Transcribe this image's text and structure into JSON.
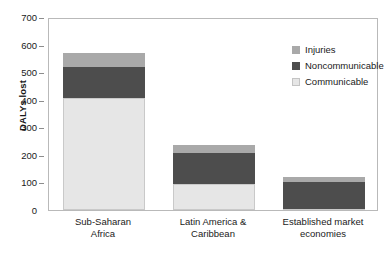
{
  "chart_data": {
    "type": "bar",
    "barmode": "stacked",
    "title": "",
    "xlabel": "",
    "ylabel": "DALYs lost",
    "ylim": [
      0,
      700
    ],
    "yticks": [
      0,
      100,
      200,
      300,
      400,
      500,
      600,
      700
    ],
    "ytick_labels": [
      "0",
      "100",
      "200",
      "300",
      "400",
      "500",
      "600",
      "700"
    ],
    "grid": false,
    "legend_position": "top-right",
    "categories": [
      "Sub-Saharan Africa",
      "Latin America & Caribbean",
      "Established market economies"
    ],
    "category_lines": [
      [
        "Sub-Saharan",
        "Africa"
      ],
      [
        "Latin America &",
        "Caribbean"
      ],
      [
        "Established market",
        "economies"
      ]
    ],
    "series": [
      {
        "name": "Communicable",
        "color": "#e6e6e6",
        "values": [
          408,
          96,
          5
        ]
      },
      {
        "name": "Noncommunicable",
        "color": "#4d4d4d",
        "values": [
          110,
          111,
          98
        ]
      },
      {
        "name": "Injuries",
        "color": "#a9a9a9",
        "values": [
          52,
          28,
          15
        ]
      }
    ],
    "totals": [
      570,
      235,
      118
    ],
    "legend_order": [
      "Injuries",
      "Noncommunicable",
      "Communicable"
    ]
  },
  "legend": {
    "items": [
      {
        "label": "Injuries",
        "swatch_class": "sw-injuries"
      },
      {
        "label": "Noncommunicable",
        "swatch_class": "sw-noncommunicable"
      },
      {
        "label": "Communicable",
        "swatch_class": "sw-communicable"
      }
    ]
  },
  "axes": {
    "y_title": "DALYs lost"
  },
  "colors": {
    "injuries": "#a9a9a9",
    "noncommunicable": "#4d4d4d",
    "communicable": "#e6e6e6",
    "frame": "#b9b9b9",
    "text": "#1a1a1a"
  }
}
